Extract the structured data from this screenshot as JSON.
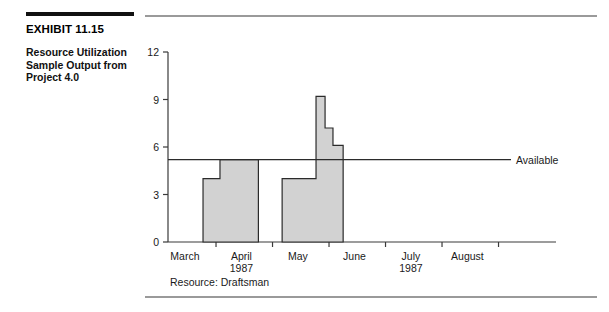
{
  "exhibit": {
    "number_label": "EXHIBIT 11.15",
    "description_line1": "Resource Utilization",
    "description_line2": "Sample Output from",
    "description_line3": "Project 4.0"
  },
  "chart_data": {
    "type": "bar",
    "title": "",
    "subtitle": "",
    "xlabel": "",
    "ylabel": "",
    "ylim": [
      0,
      12
    ],
    "yticks": [
      0,
      3,
      6,
      9,
      12
    ],
    "ytick_labels": [
      "0",
      "3",
      "6",
      "9",
      "12"
    ],
    "grid": false,
    "xlim_months": [
      "March",
      "April",
      "May",
      "June",
      "July",
      "August"
    ],
    "xtick_labels": [
      "March",
      "April",
      "May",
      "June",
      "July",
      "August"
    ],
    "xtick_sublabels": [
      "",
      "1987",
      "",
      "",
      "1987",
      ""
    ],
    "legend_position": "right-inline",
    "annotations": [
      {
        "name": "available-line",
        "label": "Available",
        "value": 5.2,
        "orientation": "horizontal"
      }
    ],
    "caption": "Resource: Draftsman",
    "series": [
      {
        "name": "Resource usage",
        "fill_color": "#d2d2d2",
        "edge_color": "#2b2b2b",
        "steps": [
          {
            "x_start_month": 0.62,
            "x_end_month": 0.92,
            "value": 4.0
          },
          {
            "x_start_month": 0.92,
            "x_end_month": 1.6,
            "value": 5.2
          },
          {
            "x_start_month": 2.02,
            "x_end_month": 2.62,
            "value": 4.0
          },
          {
            "x_start_month": 2.62,
            "x_end_month": 2.78,
            "value": 9.2
          },
          {
            "x_start_month": 2.78,
            "x_end_month": 2.92,
            "value": 7.2
          },
          {
            "x_start_month": 2.92,
            "x_end_month": 3.1,
            "value": 6.1
          }
        ]
      }
    ]
  },
  "colors": {
    "bar_fill": "#d2d2d2",
    "bar_edge": "#2b2b2b",
    "axis": "#3a3a3a",
    "rule": "#9a9a9a",
    "exhibit_rule": "#111111",
    "text": "#1a1a1a"
  }
}
